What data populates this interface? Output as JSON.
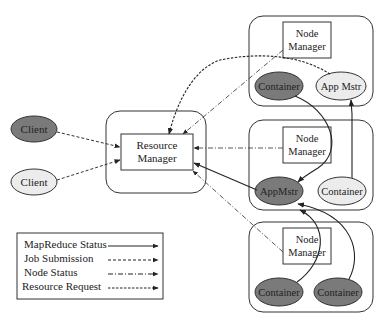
{
  "diagram": {
    "clients": [
      {
        "label": "Client",
        "style": "dark"
      },
      {
        "label": "Client",
        "style": "light"
      }
    ],
    "resource_manager": {
      "line1": "Resource",
      "line2": "Manager"
    },
    "nodes": [
      {
        "node_manager": {
          "line1": "Node",
          "line2": "Manager"
        },
        "left": {
          "label": "Container",
          "style": "dark"
        },
        "right": {
          "label": "App Mstr",
          "style": "light"
        }
      },
      {
        "node_manager": {
          "line1": "Node",
          "line2": "Manager"
        },
        "left": {
          "label": "AppMstr",
          "style": "dark"
        },
        "right": {
          "label": "Container",
          "style": "light"
        }
      },
      {
        "node_manager": {
          "line1": "Node",
          "line2": "Manager"
        },
        "left": {
          "label": "Container",
          "style": "dark"
        },
        "right": {
          "label": "Container",
          "style": "dark"
        }
      }
    ],
    "legend": [
      {
        "label": "MapReduce Status",
        "line": "solid"
      },
      {
        "label": "Job Submission",
        "line": "dashed"
      },
      {
        "label": "Node Status",
        "line": "dash-dot"
      },
      {
        "label": "Resource Request",
        "line": "dense-dashed"
      }
    ],
    "colors": {
      "dark_fill": "#7a7a7a",
      "light_fill": "#ececec",
      "stroke": "#333333"
    }
  }
}
